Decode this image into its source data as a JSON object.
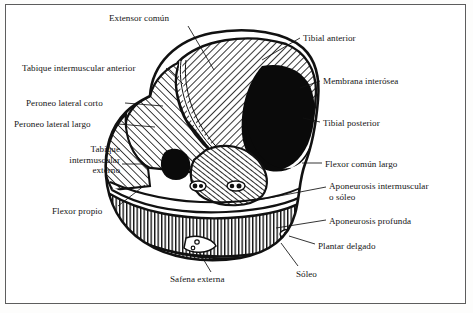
{
  "figure": {
    "title_visible": false,
    "type": "anatomical-cross-section",
    "region": "pierna (leg) transverse section",
    "language": "es",
    "frame_color": "#5d5d5d",
    "background_color": "#ffffff",
    "ink_color": "#111111"
  },
  "labels": [
    {
      "id": "extensor-comun",
      "text": "Extensor común",
      "x": 109,
      "y": 13,
      "align": "left",
      "leader": [
        [
          188,
          26
        ],
        [
          214,
          70
        ]
      ]
    },
    {
      "id": "tibial-anterior",
      "text": "Tibial anterior",
      "x": 303,
      "y": 33,
      "align": "left",
      "leader": [
        [
          300,
          38
        ],
        [
          262,
          60
        ]
      ]
    },
    {
      "id": "tabique-intermuscular-anterior",
      "text": "Tabique intermuscular anterior",
      "x": 22,
      "y": 63,
      "align": "left",
      "leader": [
        [
          166,
          68
        ],
        [
          183,
          84
        ]
      ]
    },
    {
      "id": "membrana-interosea",
      "text": "Membrana interósea",
      "x": 323,
      "y": 76,
      "align": "left",
      "leader": [
        [
          320,
          81
        ],
        [
          300,
          88
        ]
      ]
    },
    {
      "id": "peroneo-lateral-corto",
      "text": "Peroneo lateral corto",
      "x": 26,
      "y": 98,
      "align": "left",
      "leader": [
        [
          125,
          103
        ],
        [
          160,
          105
        ]
      ]
    },
    {
      "id": "tibial-posterior",
      "text": "Tibial posterior",
      "x": 323,
      "y": 118,
      "align": "left",
      "leader": [
        [
          320,
          122
        ],
        [
          303,
          118
        ]
      ]
    },
    {
      "id": "peroneo-lateral-largo",
      "text": "Peroneo lateral largo",
      "x": 14,
      "y": 119,
      "align": "left",
      "leader": [
        [
          118,
          124
        ],
        [
          152,
          126
        ]
      ]
    },
    {
      "id": "tabique-intermuscular-externo",
      "text": "Tabique\nintermuscular\nexterno",
      "x": 28,
      "y": 144,
      "align": "right",
      "leader": [
        [
          122,
          164
        ],
        [
          142,
          164
        ]
      ]
    },
    {
      "id": "flexor-comun-largo",
      "text": "Flexor común largo",
      "x": 325,
      "y": 159,
      "align": "left",
      "leader": [
        [
          322,
          163
        ],
        [
          302,
          163
        ]
      ]
    },
    {
      "id": "aponeurosis-intermuscular-o-soleo",
      "text": "Aponeurosis intermuscular\no sóleo",
      "x": 329,
      "y": 181,
      "align": "left",
      "leader": [
        [
          326,
          187
        ],
        [
          253,
          201
        ]
      ]
    },
    {
      "id": "flexor-propio",
      "text": "Flexor propio",
      "x": 52,
      "y": 206,
      "align": "left",
      "leader": [
        [
          118,
          206
        ],
        [
          143,
          186
        ]
      ]
    },
    {
      "id": "aponeurosis-profunda",
      "text": "Aponeurosis profunda",
      "x": 329,
      "y": 216,
      "align": "left",
      "leader": [
        [
          326,
          220
        ],
        [
          276,
          227
        ]
      ]
    },
    {
      "id": "plantar-delgado",
      "text": "Plantar delgado",
      "x": 318,
      "y": 241,
      "align": "left",
      "leader": [
        [
          315,
          244
        ],
        [
          290,
          236
        ]
      ]
    },
    {
      "id": "soleo",
      "text": "Sóleo",
      "x": 296,
      "y": 269,
      "align": "left",
      "leader": [
        [
          298,
          266
        ],
        [
          281,
          243
        ]
      ]
    },
    {
      "id": "safena-externa",
      "text": "Safena externa",
      "x": 170,
      "y": 274,
      "align": "left",
      "leader": [
        [
          211,
          272
        ],
        [
          199,
          252
        ]
      ]
    }
  ],
  "structures": [
    {
      "id": "anterior-compartment",
      "name": "compartimento anterior (tibial anterior / extensor común)",
      "fill": "hatch-diagonal-right"
    },
    {
      "id": "lateral-compartment",
      "name": "compartimento lateral (peroneos)",
      "fill": "hatch-diagonal-left"
    },
    {
      "id": "tibia-bone",
      "name": "tibia / membrana interósea",
      "fill": "solid-black"
    },
    {
      "id": "deep-posterior-compartment",
      "name": "compartimento posterior profundo",
      "fill": "hatch-diagonal-dense"
    },
    {
      "id": "soleus-compartment",
      "name": "sóleo",
      "fill": "hatch-vertical"
    },
    {
      "id": "superficial-posterior-compartment",
      "name": "compartimento posterior superficial",
      "fill": "hatch-vertical"
    },
    {
      "id": "fibula-bone",
      "name": "peroné",
      "fill": "solid-black"
    },
    {
      "id": "vessel-cluster-medial",
      "name": "paquete vasculonervioso medial",
      "fill": "outline"
    },
    {
      "id": "vessel-cluster-lateral",
      "name": "paquete vasculonervioso lateral",
      "fill": "outline"
    },
    {
      "id": "saphenous-vessel",
      "name": "safena externa",
      "fill": "outline"
    }
  ]
}
